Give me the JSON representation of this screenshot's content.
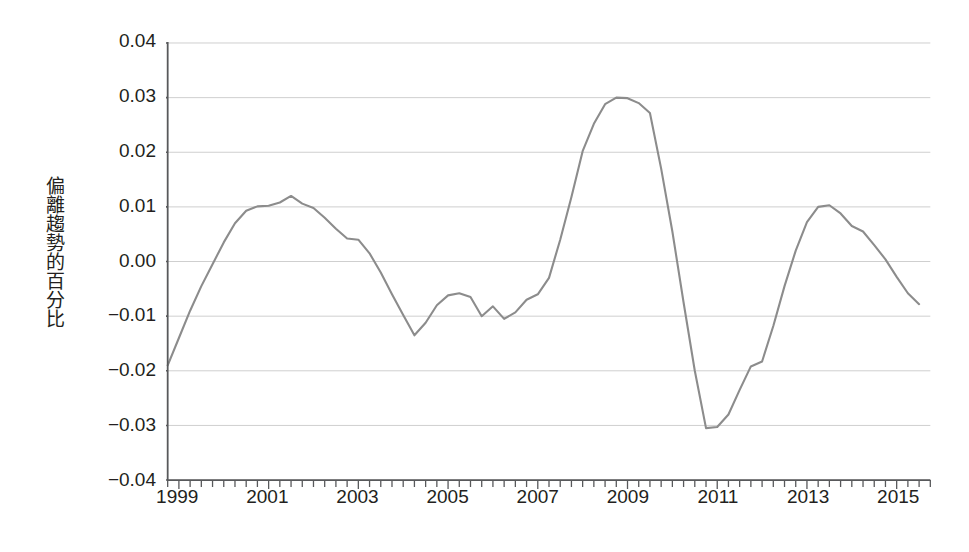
{
  "chart_data": {
    "type": "line",
    "title": "",
    "subtitle": "",
    "xlabel": "",
    "ylabel": "偏離趨勢的百分比",
    "xlim": [
      1998.75,
      2015.75
    ],
    "ylim": [
      -0.04,
      0.04
    ],
    "grid": true,
    "legend_position": "none",
    "line_color": "#8c8c8c",
    "grid_color": "#cfcfcf",
    "axis_color": "#58595b",
    "ytick_labels": [
      "0.04",
      "0.03",
      "0.02",
      "0.01",
      "0.00",
      "−0.01",
      "−0.02",
      "−0.03",
      "−0.04"
    ],
    "ytick_values": [
      0.04,
      0.03,
      0.02,
      0.01,
      0.0,
      -0.01,
      -0.02,
      -0.03,
      -0.04
    ],
    "xtick_labels": [
      "1999",
      "2001",
      "2003",
      "2005",
      "2007",
      "2009",
      "2011",
      "2013",
      "2015"
    ],
    "xtick_values": [
      1999,
      2001,
      2003,
      2005,
      2007,
      2009,
      2011,
      2013,
      2015
    ],
    "xminor_step": 0.25,
    "x": [
      1998.75,
      1999.0,
      1999.25,
      1999.5,
      1999.75,
      2000.0,
      2000.25,
      2000.5,
      2000.75,
      2001.0,
      2001.25,
      2001.5,
      2001.75,
      2002.0,
      2002.25,
      2002.5,
      2002.75,
      2003.0,
      2003.25,
      2003.5,
      2003.75,
      2004.0,
      2004.25,
      2004.5,
      2004.75,
      2005.0,
      2005.25,
      2005.5,
      2005.75,
      2006.0,
      2006.25,
      2006.5,
      2006.75,
      2007.0,
      2007.25,
      2007.5,
      2007.75,
      2008.0,
      2008.25,
      2008.5,
      2008.75,
      2009.0,
      2009.25,
      2009.5,
      2009.75,
      2010.0,
      2010.25,
      2010.5,
      2010.75,
      2011.0,
      2011.25,
      2011.5,
      2011.75,
      2012.0,
      2012.25,
      2012.5,
      2012.75,
      2013.0,
      2013.25,
      2013.5,
      2013.75,
      2014.0,
      2014.25,
      2014.5,
      2014.75,
      2015.0,
      2015.25,
      2015.5
    ],
    "y": [
      -0.019,
      -0.014,
      -0.009,
      -0.0045,
      -0.0005,
      0.0035,
      0.007,
      0.0093,
      0.0101,
      0.0102,
      0.0108,
      0.012,
      0.0106,
      0.0098,
      0.008,
      0.006,
      0.0042,
      0.004,
      0.0015,
      -0.002,
      -0.006,
      -0.0098,
      -0.0135,
      -0.0112,
      -0.008,
      -0.0062,
      -0.0058,
      -0.0065,
      -0.01,
      -0.0082,
      -0.0105,
      -0.0093,
      -0.007,
      -0.006,
      -0.003,
      0.004,
      0.0118,
      0.0202,
      0.0252,
      0.0288,
      0.03,
      0.0299,
      0.029,
      0.0272,
      0.017,
      0.0055,
      -0.0075,
      -0.02,
      -0.0305,
      -0.0303,
      -0.028,
      -0.0235,
      -0.0192,
      -0.0183,
      -0.0118,
      -0.0045,
      0.002,
      0.0072,
      0.01,
      0.0103,
      0.0088,
      0.0065,
      0.0055,
      0.003,
      0.0004,
      -0.0028,
      -0.0058,
      -0.0078
    ],
    "series": [
      {
        "name": "偏離趨勢的百分比",
        "color": "#8c8c8c",
        "values": [
          -0.019,
          -0.014,
          -0.009,
          -0.0045,
          -0.0005,
          0.0035,
          0.007,
          0.0093,
          0.0101,
          0.0102,
          0.0108,
          0.012,
          0.0106,
          0.0098,
          0.008,
          0.006,
          0.0042,
          0.004,
          0.0015,
          -0.002,
          -0.006,
          -0.0098,
          -0.0135,
          -0.0112,
          -0.008,
          -0.0062,
          -0.0058,
          -0.0065,
          -0.01,
          -0.0082,
          -0.0105,
          -0.0093,
          -0.007,
          -0.006,
          -0.003,
          0.004,
          0.0118,
          0.0202,
          0.0252,
          0.0288,
          0.03,
          0.0299,
          0.029,
          0.0272,
          0.017,
          0.0055,
          -0.0075,
          -0.02,
          -0.0305,
          -0.0303,
          -0.028,
          -0.0235,
          -0.0192,
          -0.0183,
          -0.0118,
          -0.0045,
          0.002,
          0.0072,
          0.01,
          0.0103,
          0.0088,
          0.0065,
          0.0055,
          0.003,
          0.0004,
          -0.0028,
          -0.0058,
          -0.0078
        ]
      }
    ],
    "full_points": [
      [
        1998.75,
        -0.019
      ],
      [
        1999.0,
        -0.014
      ],
      [
        1999.25,
        -0.009
      ],
      [
        1999.5,
        -0.0045
      ],
      [
        1999.75,
        -0.0005
      ],
      [
        2000.0,
        0.0035
      ],
      [
        2000.25,
        0.007
      ],
      [
        2000.5,
        0.0093
      ],
      [
        2000.75,
        0.0101
      ],
      [
        2001.0,
        0.0102
      ],
      [
        2001.25,
        0.0108
      ],
      [
        2001.5,
        0.012
      ],
      [
        2001.75,
        0.0106
      ],
      [
        2002.0,
        0.0098
      ],
      [
        2002.25,
        0.008
      ],
      [
        2002.5,
        0.006
      ],
      [
        2002.75,
        0.0042
      ],
      [
        2003.0,
        0.004
      ],
      [
        2003.25,
        0.0015
      ],
      [
        2003.5,
        -0.002
      ],
      [
        2003.75,
        -0.006
      ],
      [
        2004.0,
        -0.0098
      ],
      [
        2004.25,
        -0.0135
      ],
      [
        2004.5,
        -0.0112
      ],
      [
        2004.75,
        -0.008
      ],
      [
        2005.0,
        -0.0062
      ],
      [
        2005.25,
        -0.0058
      ],
      [
        2005.5,
        -0.0065
      ],
      [
        2005.75,
        -0.01
      ],
      [
        2006.0,
        -0.0082
      ],
      [
        2006.25,
        -0.0105
      ],
      [
        2006.5,
        -0.0093
      ],
      [
        2006.75,
        -0.007
      ],
      [
        2007.0,
        -0.006
      ],
      [
        2007.25,
        -0.003
      ],
      [
        2007.5,
        0.004
      ],
      [
        2007.75,
        0.0118
      ],
      [
        2008.0,
        0.0202
      ],
      [
        2008.25,
        0.0252
      ],
      [
        2008.5,
        0.0288
      ],
      [
        2008.75,
        0.03
      ],
      [
        2009.0,
        0.0299
      ],
      [
        2009.25,
        0.029
      ],
      [
        2009.5,
        0.0272
      ],
      [
        2009.75,
        0.017
      ],
      [
        2010.0,
        0.0055
      ],
      [
        2010.25,
        -0.0075
      ],
      [
        2010.5,
        -0.02
      ],
      [
        2010.75,
        -0.0305
      ],
      [
        2011.0,
        -0.0303
      ],
      [
        2011.25,
        -0.028
      ],
      [
        2011.5,
        -0.0235
      ],
      [
        2011.75,
        -0.0192
      ],
      [
        2012.0,
        -0.0183
      ],
      [
        2012.25,
        -0.0118
      ],
      [
        2012.5,
        -0.0045
      ],
      [
        2012.75,
        0.002
      ],
      [
        2013.0,
        0.0072
      ],
      [
        2013.25,
        0.01
      ],
      [
        2013.5,
        0.0103
      ],
      [
        2013.75,
        0.0088
      ],
      [
        2014.0,
        0.0065
      ],
      [
        2014.25,
        0.0055
      ],
      [
        2014.5,
        0.003
      ],
      [
        2014.75,
        0.0004
      ],
      [
        2015.0,
        -0.0028
      ],
      [
        2015.25,
        -0.0058
      ],
      [
        2015.5,
        -0.0078
      ]
    ],
    "key_points": {
      "start_value": -0.019,
      "first_peak_value": 0.012,
      "first_trough_value": -0.0135,
      "max_value": 0.03,
      "min_value": -0.0305,
      "second_peak_value": 0.0103,
      "second_trough_value": -0.008,
      "end_value": 0.0107
    }
  }
}
